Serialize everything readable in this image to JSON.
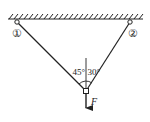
{
  "diagram": {
    "type": "statics-free-body",
    "ceiling": {
      "hatched": true
    },
    "nodes": [
      {
        "id": "1",
        "label": "①",
        "role": "ceiling-hinge-left"
      },
      {
        "id": "2",
        "label": "②",
        "role": "ceiling-hinge-right"
      },
      {
        "id": "joint",
        "label": "",
        "role": "knot"
      }
    ],
    "ropes": [
      {
        "from": "1",
        "to": "joint",
        "angle_from_vertical": "45°"
      },
      {
        "from": "2",
        "to": "joint",
        "angle_from_vertical": "30°"
      }
    ],
    "angles": {
      "left": "45°",
      "right": "30°"
    },
    "force": {
      "label": "F",
      "direction": "down"
    },
    "colors": {
      "line": "#222222",
      "background": "#ffffff"
    }
  }
}
